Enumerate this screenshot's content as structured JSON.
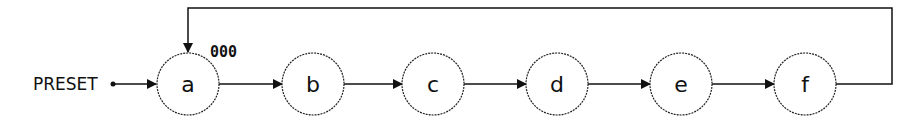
{
  "diagram": {
    "type": "state-machine",
    "preset_label": "PRESET",
    "initial_code": "000",
    "nodes": [
      {
        "id": "a",
        "label": "a",
        "cx": 188
      },
      {
        "id": "b",
        "label": "b",
        "cx": 313
      },
      {
        "id": "c",
        "label": "c",
        "cx": 433
      },
      {
        "id": "d",
        "label": "d",
        "cx": 557
      },
      {
        "id": "e",
        "label": "e",
        "cx": 681
      },
      {
        "id": "f",
        "label": "f",
        "cx": 805
      }
    ],
    "edges": [
      {
        "from": "PRESET",
        "to": "a"
      },
      {
        "from": "a",
        "to": "b"
      },
      {
        "from": "b",
        "to": "c"
      },
      {
        "from": "c",
        "to": "d"
      },
      {
        "from": "d",
        "to": "e"
      },
      {
        "from": "e",
        "to": "f"
      },
      {
        "from": "f",
        "to": "a",
        "kind": "feedback"
      }
    ],
    "colors": {
      "stroke": "#111111",
      "background": "#ffffff"
    }
  }
}
